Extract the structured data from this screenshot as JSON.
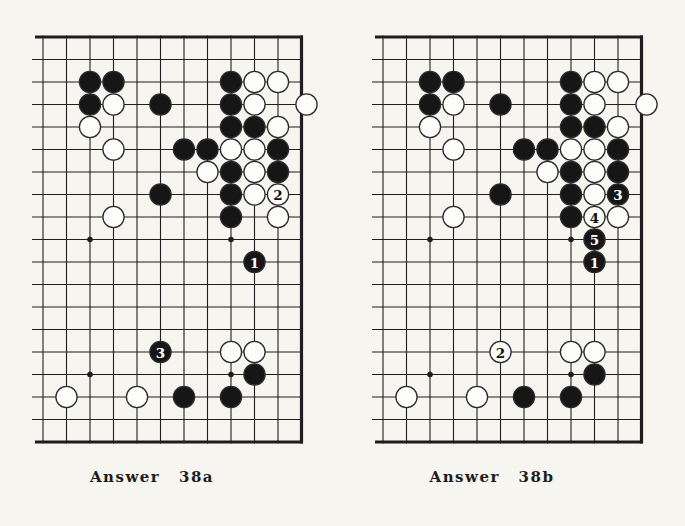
{
  "page": {
    "background": "#f6f5f0",
    "line_color": "#1e1e1e",
    "black_stone_color": "#161616",
    "white_stone_color": "#fdfdfb",
    "stone_outline_color": "#2a2a2a",
    "label_on_black_color": "#ffffff",
    "label_on_white_color": "#111111"
  },
  "board_config": {
    "cols": 12,
    "rows": 19,
    "thick_top_edge": true,
    "thick_right_edge": true,
    "thick_bottom_edge": true,
    "open_left_edge": true,
    "star_points": [
      [
        3,
        10
      ],
      [
        9,
        10
      ],
      [
        3,
        16
      ],
      [
        9,
        16
      ]
    ],
    "base_black": [
      [
        3,
        3
      ],
      [
        4,
        3
      ],
      [
        9,
        3
      ],
      [
        3,
        4
      ],
      [
        6,
        4
      ],
      [
        9,
        4
      ],
      [
        9,
        5
      ],
      [
        10,
        5
      ],
      [
        7,
        6
      ],
      [
        8,
        6
      ],
      [
        11,
        6
      ],
      [
        9,
        7
      ],
      [
        11,
        7
      ],
      [
        6,
        8
      ],
      [
        9,
        8
      ],
      [
        9,
        9
      ],
      [
        10,
        16
      ],
      [
        7,
        17
      ],
      [
        9,
        17
      ]
    ],
    "base_white": [
      [
        10,
        3
      ],
      [
        11,
        3
      ],
      [
        4,
        4
      ],
      [
        10,
        4
      ],
      [
        12,
        4
      ],
      [
        3,
        5
      ],
      [
        11,
        5
      ],
      [
        4,
        6
      ],
      [
        9,
        6
      ],
      [
        10,
        6
      ],
      [
        8,
        7
      ],
      [
        10,
        7
      ],
      [
        10,
        8
      ],
      [
        4,
        9
      ],
      [
        11,
        9
      ],
      [
        9,
        15
      ],
      [
        10,
        15
      ],
      [
        2,
        17
      ],
      [
        5,
        17
      ]
    ]
  },
  "boards": [
    {
      "id": "a",
      "caption": "Answer 38a",
      "moves": [
        {
          "n": "1",
          "color": "black",
          "c": 10,
          "r": 11
        },
        {
          "n": "2",
          "color": "white",
          "c": 11,
          "r": 8
        },
        {
          "n": "3",
          "color": "black",
          "c": 6,
          "r": 15
        }
      ]
    },
    {
      "id": "b",
      "caption": "Answer 38b",
      "moves": [
        {
          "n": "1",
          "color": "black",
          "c": 10,
          "r": 11
        },
        {
          "n": "2",
          "color": "white",
          "c": 6,
          "r": 15
        },
        {
          "n": "3",
          "color": "black",
          "c": 11,
          "r": 8
        },
        {
          "n": "4",
          "color": "white",
          "c": 10,
          "r": 9
        },
        {
          "n": "5",
          "color": "black",
          "c": 10,
          "r": 10
        }
      ]
    }
  ]
}
